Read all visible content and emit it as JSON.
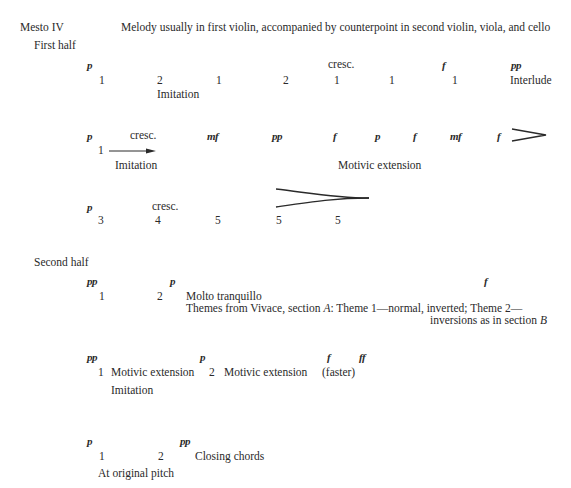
{
  "header": {
    "movement": "Mesto IV",
    "description": "Melody usually in first violin, accompanied by counterpoint in second violin, viola, and cello"
  },
  "first_half": {
    "label": "First half",
    "system1": {
      "dynamics": [
        "p",
        "cresc.",
        "f",
        "pp"
      ],
      "numbers": [
        "1",
        "2",
        "1",
        "2",
        "1",
        "1",
        "1"
      ],
      "end_label": "Interlude",
      "sub_label": "Imitation"
    },
    "system2": {
      "dynamics": [
        "p",
        "cresc.",
        "mf",
        "pp",
        "f",
        "p",
        "f",
        "mf",
        "f"
      ],
      "numbers": [
        "1"
      ],
      "sub_label_left": "Imitation",
      "sub_label_right": "Motivic extension",
      "hairpin": "decrescendo"
    },
    "system3": {
      "dynamics": [
        "p",
        "cresc."
      ],
      "numbers": [
        "3",
        "4",
        "5",
        "5",
        "5"
      ],
      "hairpin": "decrescendo"
    }
  },
  "second_half": {
    "label": "Second half",
    "system1": {
      "dynamics": [
        "pp",
        "p",
        "f"
      ],
      "numbers": [
        "1",
        "2"
      ],
      "tempo": "Molto tranquillo",
      "note_line1_a": "Themes from Vivace, section ",
      "note_line1_section": "A",
      "note_line1_b": ":  Theme 1—normal, inverted;  Theme 2—",
      "note_line2_a": "inversions as in section ",
      "note_line2_section": "B"
    },
    "system2": {
      "dynamics": [
        "pp",
        "p",
        "f",
        "ff"
      ],
      "numbers": [
        "1",
        "2"
      ],
      "labels": [
        "Motivic extension",
        "Motivic extension",
        "(faster)"
      ],
      "sub_label": "Imitation"
    },
    "system3": {
      "dynamics": [
        "p",
        "pp"
      ],
      "numbers": [
        "1",
        "2"
      ],
      "end_label": "Closing chords",
      "sub_label": "At original pitch"
    }
  }
}
